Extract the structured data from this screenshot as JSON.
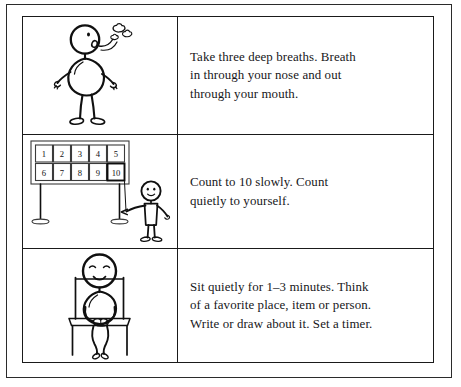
{
  "document": {
    "title": "Calming Strategies Worksheet",
    "type": "three-step instruction table"
  },
  "table": {
    "columns": [
      "illustration",
      "instruction"
    ],
    "rows": [
      {
        "step": 1,
        "illustration_name": "stick-figure-deep-breathing",
        "illustration_description": "Standing stick figure in profile exhaling breath puffs from the mouth",
        "instruction": "Take three deep breaths. Breath\nin through your nose and out\nthrough your mouth."
      },
      {
        "step": 2,
        "illustration_name": "number-board-counting",
        "illustration_description": "Stick figure pointing at a number board showing 1 to 10 with 10 highlighted",
        "instruction": "Count to 10 slowly. Count\nquietly to yourself."
      },
      {
        "step": 3,
        "illustration_name": "stick-figure-sitting-quietly",
        "illustration_description": "Stick figure sitting on a chair with hands folded in lap, eyes closed and smiling",
        "instruction": "Sit quietly for 1–3 minutes. Think\nof a favorite place, item or person.\nWrite or draw about it. Set a timer."
      }
    ]
  },
  "number_board": {
    "row_top": [
      "1",
      "2",
      "3",
      "4",
      "5"
    ],
    "row_bottom": [
      "6",
      "7",
      "8",
      "9",
      "10"
    ],
    "highlighted_value": "10"
  },
  "colors": {
    "ink": "#101010",
    "text": "#17171a",
    "border": "#1a1a1a",
    "page_background": "#ffffff",
    "board_stroke": "#3b3b3b"
  }
}
